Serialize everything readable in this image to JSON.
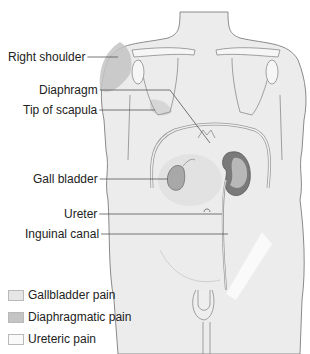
{
  "labels": [
    {
      "id": "right-shoulder",
      "text": "Right shoulder",
      "x": 8,
      "y": 50,
      "lineTo": [
        118,
        57
      ]
    },
    {
      "id": "diaphragm",
      "text": "Diaphragm",
      "x": 39,
      "y": 83,
      "lineTo": [
        210,
        143
      ]
    },
    {
      "id": "tip-of-scapula",
      "text": "Tip of scapula",
      "x": 23,
      "y": 103,
      "lineTo": [
        155,
        110
      ]
    },
    {
      "id": "gall-bladder",
      "text": "Gall bladder",
      "x": 33,
      "y": 172,
      "lineTo": [
        168,
        179
      ]
    },
    {
      "id": "ureter",
      "text": "Ureter",
      "x": 64,
      "y": 207,
      "lineTo": [
        222,
        214
      ]
    },
    {
      "id": "inguinal-canal",
      "text": "Inguinal canal",
      "x": 25,
      "y": 227,
      "lineTo": [
        228,
        234
      ]
    }
  ],
  "legend": [
    {
      "id": "gallbladder-pain",
      "text": "Gallbladder pain",
      "color": "#e6e6e6",
      "y": 288
    },
    {
      "id": "diaphragmatic-pain",
      "text": "Diaphragmatic pain",
      "color": "#c4c4c4",
      "y": 310
    },
    {
      "id": "ureteric-pain",
      "text": "Ureteric pain",
      "color": "#f9f9f9",
      "y": 332
    }
  ],
  "colors": {
    "body": "#ececec",
    "outline": "#8a8a8a",
    "bone": "#f6f6f6",
    "kidney": "#7a7a7a",
    "gallbladder": "#a8a8a8",
    "diaphragmatic": "#c0c0c0",
    "gallbladder_zone": "#e0e0e0",
    "ureteric_zone": "#fbfbfb"
  }
}
